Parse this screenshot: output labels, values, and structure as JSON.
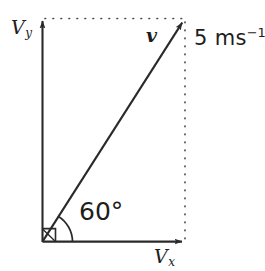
{
  "figure": {
    "type": "vector-decomposition-diagram",
    "background_color": "#ffffff",
    "stroke_color": "#2a2a2a",
    "geometry": {
      "origin": [
        42,
        242
      ],
      "x_axis_tip": [
        185,
        242
      ],
      "y_axis_tip": [
        42,
        18
      ],
      "vector_tip": [
        185,
        18
      ],
      "angle_arc_radius": 30,
      "right_angle_marker_size": 13
    },
    "labels": {
      "y_axis": {
        "symbol": "V",
        "subscript": "y"
      },
      "x_axis": {
        "symbol": "V",
        "subscript": "x"
      },
      "vector": "v",
      "magnitude_value": "5 ms",
      "magnitude_exponent": "−1",
      "angle": "60°"
    },
    "elements": {
      "y_axis_name": "vertical-component-axis",
      "x_axis_name": "horizontal-component-axis",
      "vector_name": "resultant-velocity-vector",
      "dotted_top_name": "projection-line-horizontal",
      "dotted_right_name": "projection-line-vertical",
      "arc_name": "angle-arc",
      "right_angle_name": "right-angle-marker"
    }
  }
}
